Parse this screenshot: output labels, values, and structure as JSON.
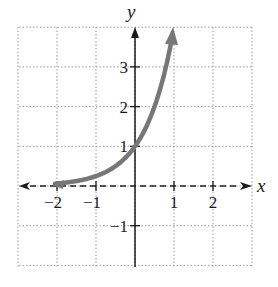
{
  "chart_data": {
    "type": "line",
    "title": "",
    "function": "y = 4^x",
    "xlabel": "x",
    "ylabel": "y",
    "xlim": [
      -3,
      3
    ],
    "ylim": [
      -2,
      4
    ],
    "grid": true,
    "grid_style": "dotted",
    "x_ticks": [
      -2,
      -1,
      1,
      2
    ],
    "x_tick_labels": [
      "−2",
      "−1",
      "1",
      "2"
    ],
    "y_ticks": [
      -1,
      1,
      2,
      3
    ],
    "y_tick_labels": [
      "−1",
      "1",
      "2",
      "3"
    ],
    "asymptote": {
      "type": "horizontal",
      "y": 0,
      "style": "dashed"
    },
    "series": [
      {
        "name": "f(x)",
        "color": "#777777",
        "x": [
          -2.1,
          -2,
          -1.5,
          -1,
          -0.5,
          0,
          0.25,
          0.5,
          0.75,
          1
        ],
        "values": [
          0.05,
          0.0625,
          0.125,
          0.25,
          0.5,
          1,
          1.41,
          2,
          2.83,
          4
        ]
      }
    ],
    "points_highlighted": [
      [
        0,
        1
      ]
    ]
  }
}
